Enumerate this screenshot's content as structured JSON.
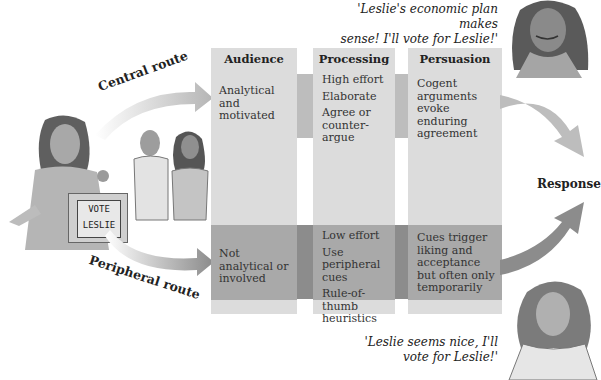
{
  "quotes": {
    "central": "'Leslie's economic plan makes sense! I'll vote for Leslie!'",
    "central_line1": "'Leslie's economic plan makes",
    "central_line2": "sense! I'll vote for Leslie!'",
    "peripheral_line1": "'Leslie seems nice, I'll",
    "peripheral_line2": "vote for Leslie!'"
  },
  "routes": {
    "central": "Central route",
    "peripheral": "Peripheral route"
  },
  "podium": {
    "line1": "VOTE",
    "line2": "LESLIE"
  },
  "columns": [
    {
      "header": "Audience",
      "central": [
        "Analytical and motivated"
      ],
      "peripheral": [
        "Not analytical or involved"
      ]
    },
    {
      "header": "Processing",
      "central": [
        "High effort",
        "Elaborate",
        "Agree or counter-argue"
      ],
      "peripheral": [
        "Low effort",
        "Use peripheral cues",
        "Rule-of-thumb heuristics"
      ]
    },
    {
      "header": "Persuasion",
      "central": [
        "Cogent arguments evoke enduring agreement"
      ],
      "peripheral": [
        "Cues trigger liking and acceptance but often only temporarily"
      ]
    }
  ],
  "outcome": "Response",
  "colors": {
    "column_bg": "#dcdcdc",
    "central_band": "#d6d6d6",
    "peripheral_band": "#a9a9a9",
    "central_arrow": "#bdbdbd",
    "peripheral_arrow": "#8c8c8c"
  }
}
